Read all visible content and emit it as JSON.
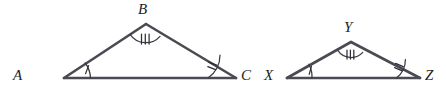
{
  "figure": {
    "background_color": "#ffffff",
    "line_color": "#4a4a52",
    "label_color": "#1d1d22",
    "width": 446,
    "height": 93,
    "triangles": [
      {
        "name": "triangle-abc",
        "vertices": [
          {
            "label": "A",
            "role": "left-base",
            "x": 64,
            "y": 78,
            "label_x": 13,
            "label_y": 68,
            "arc_ticks": 1
          },
          {
            "label": "B",
            "role": "apex",
            "x": 146,
            "y": 24,
            "label_x": 138,
            "label_y": 2,
            "arc_ticks": 3
          },
          {
            "label": "C",
            "role": "right-base",
            "x": 236,
            "y": 78,
            "label_x": 241,
            "label_y": 68,
            "arc_ticks": 2
          }
        ]
      },
      {
        "name": "triangle-xyz",
        "vertices": [
          {
            "label": "X",
            "role": "left-base",
            "x": 287,
            "y": 78,
            "label_x": 264,
            "label_y": 68,
            "arc_ticks": 1
          },
          {
            "label": "Y",
            "role": "apex",
            "x": 351,
            "y": 42,
            "label_x": 344,
            "label_y": 20,
            "arc_ticks": 3
          },
          {
            "label": "Z",
            "role": "right-base",
            "x": 420,
            "y": 78,
            "label_x": 425,
            "label_y": 68,
            "arc_ticks": 2
          }
        ]
      }
    ]
  }
}
